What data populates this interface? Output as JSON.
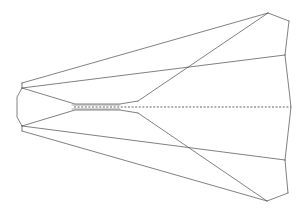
{
  "figure": {
    "background_color": "#ffffff",
    "line_color": "#4a4a4a",
    "dashed_line_color": "#3c3c3c",
    "width": 306,
    "height": 214,
    "projection": "plan view (top-down)",
    "symmetry_axis_y": 107
  },
  "chart_data": {
    "type": "line",
    "xlabel": "",
    "ylabel": "",
    "xlim": [
      0,
      306
    ],
    "ylim": [
      0,
      214
    ],
    "grid": false,
    "legend": "none",
    "series": [
      {
        "name": "upper-wing-leading-edge",
        "style": "solid",
        "points": [
          [
            22,
            83
          ],
          [
            268,
            13
          ]
        ]
      },
      {
        "name": "upper-wing-trailing-edge",
        "style": "solid",
        "points": [
          [
            268,
            13
          ],
          [
            289,
            21
          ]
        ]
      },
      {
        "name": "upper-outboard-panel-edge",
        "style": "solid",
        "points": [
          [
            289,
            21
          ],
          [
            285,
            55
          ]
        ]
      },
      {
        "name": "upper-fuselage-chine",
        "style": "solid",
        "points": [
          [
            22,
            88
          ],
          [
            285,
            55
          ]
        ]
      },
      {
        "name": "upper-wing-root-diagonal",
        "style": "solid",
        "points": [
          [
            268,
            13
          ],
          [
            138,
            101
          ]
        ]
      },
      {
        "name": "upper-nose-shoulder",
        "style": "solid",
        "points": [
          [
            22,
            83
          ],
          [
            22,
            88
          ]
        ]
      },
      {
        "name": "nose-left-profile-upper",
        "style": "solid",
        "points": [
          [
            22,
            88
          ],
          [
            17,
            97
          ]
        ]
      },
      {
        "name": "nose-left-profile-mid",
        "style": "solid",
        "points": [
          [
            17,
            97
          ],
          [
            17,
            117
          ]
        ]
      },
      {
        "name": "nose-left-profile-lower",
        "style": "solid",
        "points": [
          [
            17,
            117
          ],
          [
            22,
            126
          ]
        ]
      },
      {
        "name": "lower-nose-shoulder",
        "style": "solid",
        "points": [
          [
            22,
            126
          ],
          [
            22,
            131
          ]
        ]
      },
      {
        "name": "lower-fuselage-chine",
        "style": "solid",
        "points": [
          [
            22,
            126
          ],
          [
            285,
            160
          ]
        ]
      },
      {
        "name": "lower-wing-leading-edge",
        "style": "solid",
        "points": [
          [
            22,
            131
          ],
          [
            267,
            201
          ]
        ]
      },
      {
        "name": "lower-wing-trailing-edge",
        "style": "solid",
        "points": [
          [
            267,
            201
          ],
          [
            288,
            193
          ]
        ]
      },
      {
        "name": "lower-outboard-panel-edge",
        "style": "solid",
        "points": [
          [
            288,
            193
          ],
          [
            285,
            160
          ]
        ]
      },
      {
        "name": "lower-wing-root-diagonal",
        "style": "solid",
        "points": [
          [
            267,
            201
          ],
          [
            138,
            113
          ]
        ]
      },
      {
        "name": "right-edge-upper",
        "style": "solid",
        "points": [
          [
            285,
            55
          ],
          [
            291,
            107
          ]
        ]
      },
      {
        "name": "right-edge-lower",
        "style": "solid",
        "points": [
          [
            291,
            107
          ],
          [
            285,
            160
          ]
        ]
      },
      {
        "name": "canopy-upper-fairing",
        "style": "solid",
        "points": [
          [
            22,
            88
          ],
          [
            75,
            104
          ],
          [
            120,
            104
          ],
          [
            138,
            101
          ]
        ]
      },
      {
        "name": "canopy-lower-fairing",
        "style": "solid",
        "points": [
          [
            22,
            126
          ],
          [
            75,
            110
          ],
          [
            120,
            110
          ],
          [
            138,
            113
          ]
        ]
      },
      {
        "name": "slit-upper-edge",
        "style": "solid",
        "points": [
          [
            72,
            105
          ],
          [
            120,
            105
          ]
        ]
      },
      {
        "name": "slit-lower-edge",
        "style": "solid",
        "points": [
          [
            72,
            109
          ],
          [
            120,
            109
          ]
        ]
      },
      {
        "name": "centerline-hidden-axis",
        "style": "dashed",
        "points": [
          [
            74,
            107
          ],
          [
            291,
            107
          ]
        ]
      }
    ],
    "annotations": []
  }
}
